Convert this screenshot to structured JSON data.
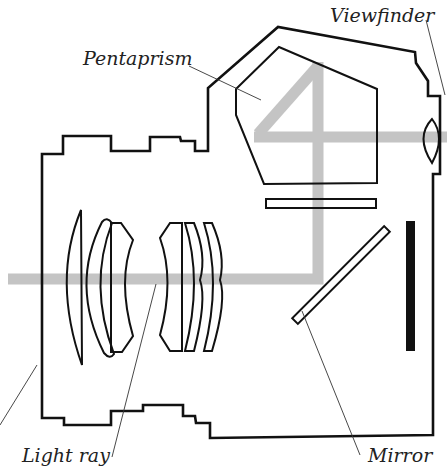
{
  "diagram": {
    "labels": {
      "pentaprism": "Pentaprism",
      "viewfinder": "Viewfinder",
      "light_ray": "Light ray",
      "mirror": "Mirror"
    },
    "components": [
      {
        "name": "lens-barrel",
        "description": "Stepped lens housing outline"
      },
      {
        "name": "front-lens-group",
        "count": 3
      },
      {
        "name": "rear-lens-group",
        "count": 3
      },
      {
        "name": "camera-body",
        "description": "Body outline with pentaprism housing"
      },
      {
        "name": "pentaprism"
      },
      {
        "name": "focusing-screen"
      },
      {
        "name": "reflex-mirror",
        "angle": "45 degrees"
      },
      {
        "name": "eyepiece-lens"
      },
      {
        "name": "film-plane"
      },
      {
        "name": "light-ray-path"
      }
    ],
    "colors": {
      "outline": "#111111",
      "light_ray": "#c4c4c4",
      "background": "#ffffff",
      "text": "#222222"
    }
  }
}
